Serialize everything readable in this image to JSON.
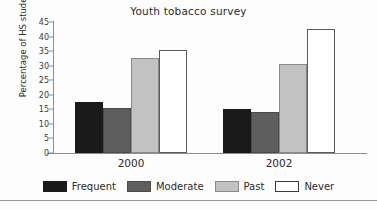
{
  "chart_data": {
    "type": "bar",
    "title": "Youth tobacco survey",
    "xlabel": "",
    "ylabel": "Percentage of HS student",
    "categories": [
      "2000",
      "2002"
    ],
    "series": [
      {
        "name": "Frequent",
        "values": [
          17.5,
          15
        ],
        "color": "#1a1a1a"
      },
      {
        "name": "Moderate",
        "values": [
          15.5,
          14
        ],
        "color": "#5e5e5e"
      },
      {
        "name": "Past",
        "values": [
          32.5,
          30.5
        ],
        "color": "#c2c2c2"
      },
      {
        "name": "Never",
        "values": [
          35.5,
          42.5
        ],
        "color": "#ffffff"
      }
    ],
    "ylim": [
      0,
      45
    ],
    "yticks": [
      0,
      5,
      10,
      15,
      20,
      25,
      30,
      35,
      40,
      45
    ],
    "ytick_labels": [
      "0",
      "5",
      "10",
      "15",
      "20",
      "25",
      "30",
      "35",
      "40",
      "45"
    ],
    "grid": false,
    "legend_position": "bottom"
  }
}
